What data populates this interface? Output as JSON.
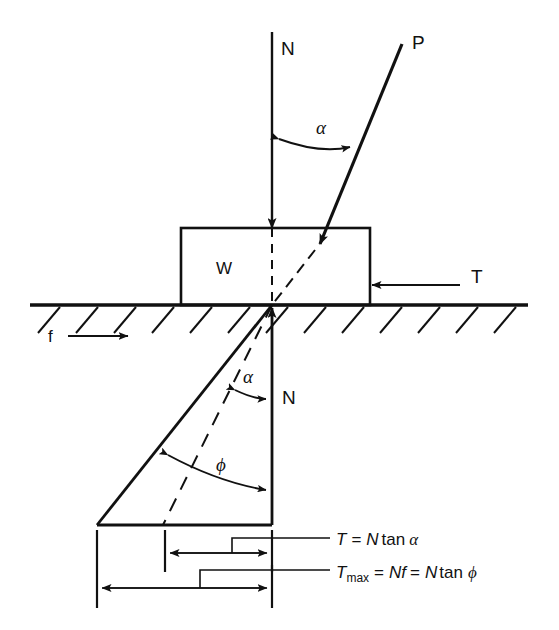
{
  "figure": {
    "type": "free-body-force-diagram",
    "background_color": "#ffffff",
    "line_color": "#111111"
  },
  "labels": {
    "normal_force_top": "N",
    "applied_force": "P",
    "alpha_top": "α",
    "block_weight": "W",
    "tangential_force": "T",
    "friction_coefficient": "f",
    "alpha_lower": "α",
    "normal_force_lower": "N",
    "friction_angle": "ϕ"
  },
  "formulas": {
    "tangential": {
      "lhs": "T",
      "eq": "=",
      "rhs_var": "N",
      "rhs_fn": "tan",
      "rhs_angle": "α",
      "full": "T = N tan α"
    },
    "tangential_max": {
      "lhs": "T",
      "lhs_sub": "max",
      "eq1": "=",
      "mid_var": "N",
      "mid_sym": "f",
      "eq2": "=",
      "rhs_var": "N",
      "rhs_fn": "tan",
      "rhs_angle": "ϕ",
      "full": "Tmax = Nf = N tan ϕ"
    }
  },
  "elements": {
    "ground_line": "ground-surface",
    "hatching": "ground-hatching",
    "block": "sliding-block",
    "dashed_vertical": "vertical-centerline-dashed",
    "dashed_inclined": "force-P-extension-dashed",
    "friction_cone": "friction-cone-triangle",
    "dimension_upper": "dimension-T",
    "dimension_lower": "dimension-Tmax"
  },
  "geometry": {
    "contact_point_x": 272,
    "contact_point_y": 305,
    "block_left": 181,
    "block_right": 370,
    "block_top": 228,
    "ground_y": 305,
    "triangle_apex_x": 97,
    "triangle_base_y": 525,
    "dimension_upper_y": 553,
    "dimension_lower_y": 588,
    "dimension_upper_left_x": 165,
    "dimension_lower_left_x": 97
  }
}
